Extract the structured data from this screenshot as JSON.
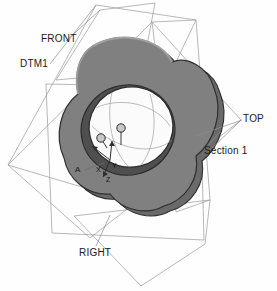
{
  "viewport": {
    "background_color": "#fefefe",
    "model_name": "trefoil-disc-with-bore"
  },
  "datum_planes": [
    {
      "id": "front",
      "label": "FRONT",
      "color": "#8a8a8a"
    },
    {
      "id": "dtm1",
      "label": "DTM1",
      "color": "#8a8a8a"
    },
    {
      "id": "top",
      "label": "TOP",
      "color": "#8a8a8a"
    },
    {
      "id": "right",
      "label": "RIGHT",
      "color": "#8a8a8a"
    }
  ],
  "annotations": {
    "section_label": "Section 1",
    "datum_tag_a": "A"
  },
  "coordinate_system": {
    "axes": [
      {
        "name": "x-axis",
        "label": "X"
      },
      {
        "name": "y-axis",
        "label": "Y"
      },
      {
        "name": "z-axis",
        "label": "Z"
      }
    ]
  },
  "colors": {
    "face_fill": "#808080",
    "rim_dark": "#6a6a6a",
    "edge_line": "#2e2e2e",
    "bore_fill": "#fbfbfb",
    "plane_line": "#9a9a9a",
    "leader_line": "#8c8c8c",
    "text": "#1a1a1a"
  }
}
